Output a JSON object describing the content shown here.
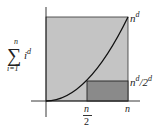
{
  "diagram": {
    "y_axis_label": {
      "sum_symbol": "∑",
      "upper_limit": "n",
      "lower_limit": "i=1",
      "term_base": "i",
      "term_exponent": "d"
    },
    "labels": {
      "top_right_base": "n",
      "top_right_exp": "d",
      "mid_right_base": "n",
      "mid_right_exp": "d",
      "mid_right_slash": "/2",
      "mid_right_exp2": "d",
      "x_half_num": "n",
      "x_half_den": "2",
      "x_end": "n"
    },
    "regions": [
      {
        "name": "outer-square",
        "from": [
          0,
          0
        ],
        "to": [
          "n",
          "n^d"
        ],
        "color": "#c4c4c4"
      },
      {
        "name": "lower-bound-rect",
        "from": [
          "n/2",
          0
        ],
        "to": [
          "n",
          "n^d/2^d"
        ],
        "color": "#8a8a8a"
      }
    ],
    "curve": {
      "function": "x^d",
      "domain": [
        0,
        "n"
      ],
      "color": "#111111"
    },
    "colors": {
      "outer_fill": "#c4c4c4",
      "inner_fill": "#8a8a8a",
      "stroke": "#222222",
      "curve": "#111111"
    }
  }
}
